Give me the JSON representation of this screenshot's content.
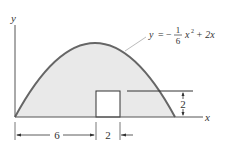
{
  "diagram": {
    "axes": {
      "x_label": "x",
      "y_label": "y"
    },
    "equation": {
      "lhs": "y",
      "eq": "=",
      "minus": "−",
      "frac_num": "1",
      "frac_den": "6",
      "term1": "x",
      "exp": "2",
      "rest": "+ 2x"
    },
    "dimensions": {
      "width_6": "6",
      "width_2": "2",
      "height_2": "2"
    },
    "colors": {
      "fill": "#e9e9e9",
      "curve": "#666666",
      "line": "#333333"
    }
  }
}
